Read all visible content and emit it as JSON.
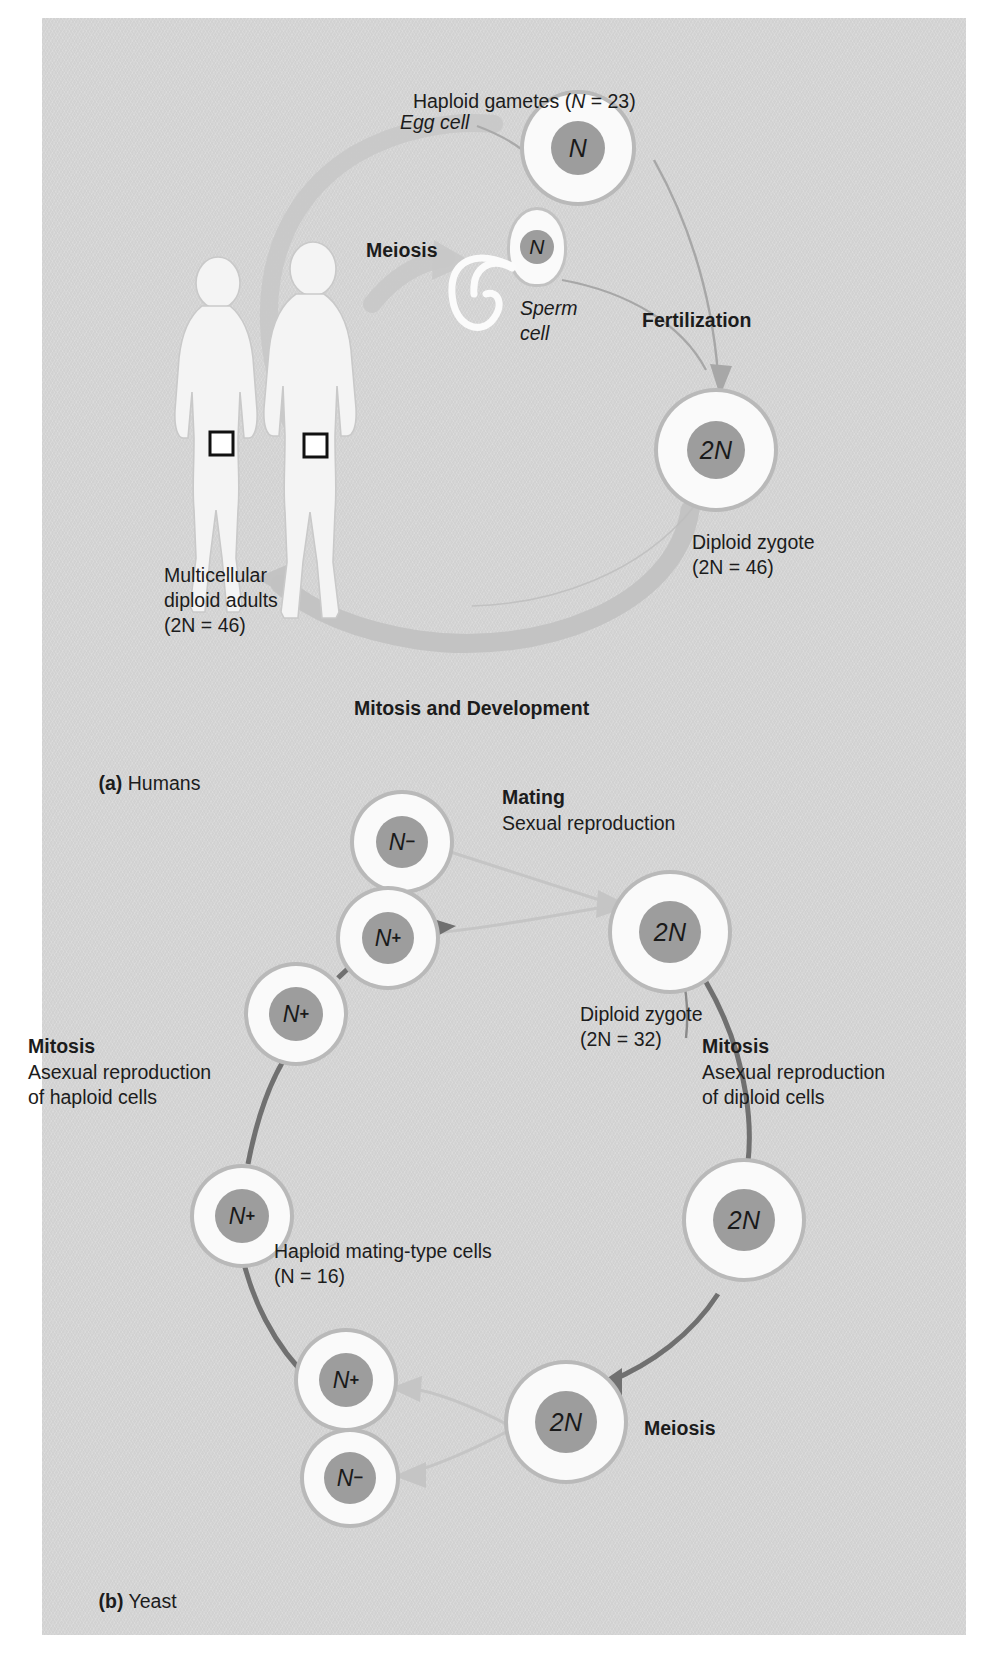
{
  "figure": {
    "title_a": "(a) Humans",
    "title_b": "(b) Yeast",
    "background_color": "#d5d5d5",
    "cell_fill_color": "#fafafa",
    "nucleus_color": "#9d9d9d",
    "arrow_color": "#6e6e6e"
  },
  "panel_a": {
    "label_prefix": "(a)",
    "label_text": "Humans",
    "headline": "Haploid gametes (N = 23)",
    "headline_parts": {
      "lead": "Haploid gametes (",
      "italic_n": "N",
      "tail": " = 23)"
    },
    "egg_label": "Egg cell",
    "egg_nucleus": "N",
    "sperm_label_line1": "Sperm",
    "sperm_label_line2": "cell",
    "sperm_nucleus": "N",
    "meiosis_label": "Meiosis",
    "fertilization_label": "Fertilization",
    "mitosis_development_label": "Mitosis and Development",
    "zygote_nucleus": "2N",
    "zygote_label_line1": "Diploid zygote",
    "zygote_label_line2": "(2N = 46)",
    "adults_label_line1": "Multicellular",
    "adults_label_line2": "diploid adults",
    "adults_label_line3": "(2N = 46)"
  },
  "panel_b": {
    "label_prefix": "(b)",
    "label_text": "Yeast",
    "mating_label": "Mating",
    "mating_sub": "Sexual reproduction",
    "zygote_nucleus": "2N",
    "zygote_label_line1": "Diploid zygote",
    "zygote_label_line2": "(2N = 32)",
    "mitosis_right_title": "Mitosis",
    "mitosis_right_line1": "Asexual reproduction",
    "mitosis_right_line2": "of diploid cells",
    "mitosis_left_title": "Mitosis",
    "mitosis_left_line1": "Asexual reproduction",
    "mitosis_left_line2": "of haploid cells",
    "haploid_label_line1": "Haploid mating-type cells",
    "haploid_label_line2": "(N = 16)",
    "meiosis_label": "Meiosis",
    "cells": [
      {
        "name": "gamete-minus-top",
        "nucleus": "N",
        "charge": "-"
      },
      {
        "name": "gamete-plus-top",
        "nucleus": "N",
        "charge": "+"
      },
      {
        "name": "haploid-plus-upper",
        "nucleus": "N",
        "charge": "+"
      },
      {
        "name": "haploid-plus-lower",
        "nucleus": "N",
        "charge": "+"
      },
      {
        "name": "meiosis-product-plus",
        "nucleus": "N",
        "charge": "+"
      },
      {
        "name": "meiosis-product-minus",
        "nucleus": "N",
        "charge": "-"
      },
      {
        "name": "zygote-2n",
        "nucleus": "2N",
        "charge": ""
      },
      {
        "name": "diploid-mid-2n",
        "nucleus": "2N",
        "charge": ""
      },
      {
        "name": "diploid-low-2n",
        "nucleus": "2N",
        "charge": ""
      }
    ]
  }
}
